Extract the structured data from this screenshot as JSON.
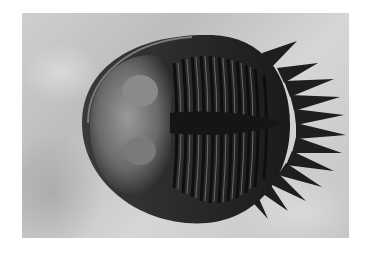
{
  "image": {
    "subject": "trilobite fossil on rock matrix",
    "style": "grayscale photograph",
    "colors": {
      "border": "#ffffff",
      "matrix": "#c8c8c8",
      "fossil_dark": "#1e1e1e",
      "fossil_mid": "#555555",
      "fossil_light": "#9a9a9a"
    }
  }
}
